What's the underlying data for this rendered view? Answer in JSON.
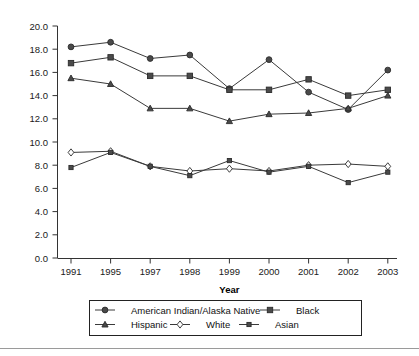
{
  "chart_data": {
    "type": "line",
    "title": "",
    "xlabel": "Year",
    "ylabel": "",
    "categories": [
      "1991",
      "1995",
      "1997",
      "1998",
      "1999",
      "2000",
      "2001",
      "2002",
      "2003"
    ],
    "ylim": [
      0.0,
      20.0
    ],
    "ytick_step": 2.0,
    "ytick_labels": [
      "0.0",
      "2.0",
      "4.0",
      "6.0",
      "8.0",
      "10.0",
      "12.0",
      "14.0",
      "16.0",
      "18.0",
      "20.0"
    ],
    "grid": false,
    "legend_position": "bottom",
    "series": [
      {
        "name": "American Indian/Alaska Native",
        "marker": "filled-circle",
        "values": [
          18.2,
          18.6,
          17.2,
          17.5,
          14.6,
          17.1,
          14.3,
          12.8,
          16.2
        ]
      },
      {
        "name": "Black",
        "marker": "filled-square",
        "values": [
          16.8,
          17.3,
          15.7,
          15.7,
          14.5,
          14.5,
          15.4,
          14.0,
          14.5
        ]
      },
      {
        "name": "Hispanic",
        "marker": "filled-triangle",
        "values": [
          15.5,
          15.0,
          12.9,
          12.9,
          11.8,
          12.4,
          12.5,
          12.9,
          14.0
        ]
      },
      {
        "name": "White",
        "marker": "open-diamond",
        "values": [
          9.1,
          9.2,
          7.9,
          7.5,
          7.7,
          7.5,
          8.0,
          8.1,
          7.9
        ]
      },
      {
        "name": "Asian",
        "marker": "small-filled-square",
        "values": [
          7.8,
          9.1,
          7.9,
          7.1,
          8.4,
          7.4,
          7.9,
          6.5,
          7.4
        ]
      }
    ]
  },
  "axes": {
    "x_title": "Year",
    "x_tick_labels": [
      "1991",
      "1995",
      "1997",
      "1998",
      "1999",
      "2000",
      "2001",
      "2002",
      "2003"
    ],
    "y_tick_labels": [
      "20.0",
      "18.0",
      "16.0",
      "14.0",
      "12.0",
      "10.0",
      "8.0",
      "6.0",
      "4.0",
      "2.0",
      "0.0"
    ]
  },
  "legend": {
    "entries": [
      {
        "label": "American Indian/Alaska Native",
        "marker": "filled-circle"
      },
      {
        "label": "Black",
        "marker": "filled-square"
      },
      {
        "label": "Hispanic",
        "marker": "filled-triangle"
      },
      {
        "label": "White",
        "marker": "open-diamond"
      },
      {
        "label": "Asian",
        "marker": "small-filled-square"
      }
    ]
  },
  "colors": {
    "line": "#3a3a3a",
    "marker_fill": "#4a4a4a",
    "marker_open_fill": "#ffffff",
    "axis": "#333333",
    "text": "#111111",
    "background": "#ffffff"
  }
}
